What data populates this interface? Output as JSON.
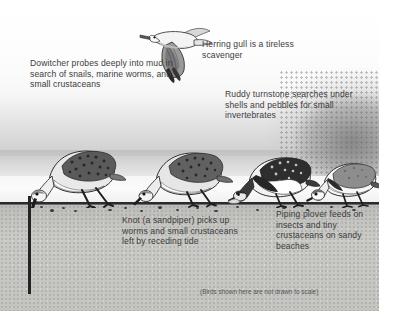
{
  "illustration": {
    "title": "Shorebirds feeding at the tide line",
    "disclaimer": "(Birds shown here are not drawn to scale)",
    "colors": {
      "sky": "#f2f2f2",
      "sand": "#c9c9c5",
      "ground_line": "#2b2b2b",
      "text": "#3c3c3c"
    }
  },
  "captions": {
    "dowitcher": "Dowitcher probes deeply into mud in search of snails, marine worms, and small crustaceans",
    "herring_gull": "Herring gull is a tireless scavenger",
    "ruddy_turnstone": "Ruddy turnstone searches under shells and pebbles for small invertebrates",
    "knot": "Knot (a sandpiper) picks up worms and small crustaceans left by receding tide",
    "piping_plover": "Piping plover feeds on insects and tiny crustaceans on sandy beaches"
  },
  "birds": [
    {
      "name": "herring-gull",
      "label": "Herring gull",
      "pose": "flying"
    },
    {
      "name": "dowitcher",
      "label": "Dowitcher",
      "pose": "probing-mud"
    },
    {
      "name": "knot",
      "label": "Knot",
      "pose": "pecking"
    },
    {
      "name": "ruddy-turnstone",
      "label": "Ruddy turnstone",
      "pose": "turning-shells"
    },
    {
      "name": "piping-plover",
      "label": "Piping plover",
      "pose": "pecking"
    }
  ]
}
